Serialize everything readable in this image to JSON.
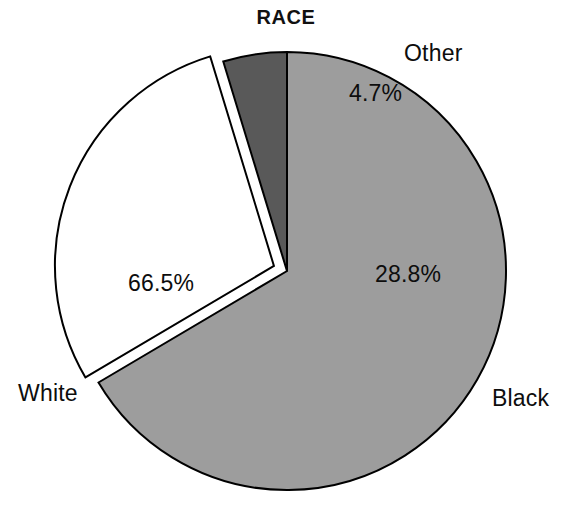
{
  "chart_data": {
    "type": "pie",
    "title": "RACE",
    "xlabel": "",
    "ylabel": "",
    "exploded_slice": "Black",
    "legend_position": "none",
    "grid": false,
    "categories": [
      "White",
      "Black",
      "Other"
    ],
    "values": [
      66.5,
      28.8,
      4.7
    ],
    "value_labels": [
      "66.5%",
      "28.8%",
      "4.7%"
    ],
    "colors": [
      "#9d9d9d",
      "#ffffff",
      "#595959"
    ],
    "outline_color": "#000000",
    "slices": [
      {
        "name": "White",
        "label": "White",
        "value": 66.5,
        "value_label": "66.5%",
        "color": "#9d9d9d",
        "exploded": false
      },
      {
        "name": "Black",
        "label": "Black",
        "value": 28.8,
        "value_label": "28.8%",
        "color": "#ffffff",
        "exploded": true
      },
      {
        "name": "Other",
        "label": "Other",
        "value": 4.7,
        "value_label": "4.7%",
        "color": "#595959",
        "exploded": false
      }
    ]
  },
  "geometry": {
    "center_x": 287,
    "center_y": 271,
    "radius": 219,
    "start_angle_deg": -90,
    "explode_offset": 14,
    "background": "#ffffff"
  }
}
